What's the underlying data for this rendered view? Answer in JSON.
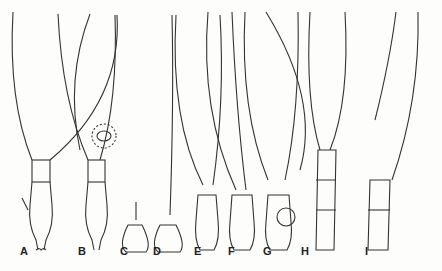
{
  "figure": {
    "labels": [
      {
        "id": "A",
        "text": "A",
        "x": 20,
        "y": 255
      },
      {
        "id": "B",
        "text": "B",
        "x": 78,
        "y": 255
      },
      {
        "id": "C",
        "text": "C",
        "x": 120,
        "y": 255
      },
      {
        "id": "D",
        "text": "D",
        "x": 153,
        "y": 255
      },
      {
        "id": "E",
        "text": "E",
        "x": 194,
        "y": 255
      },
      {
        "id": "F",
        "text": "F",
        "x": 228,
        "y": 255
      },
      {
        "id": "G",
        "text": "G",
        "x": 263,
        "y": 255
      },
      {
        "id": "H",
        "text": "H",
        "x": 301,
        "y": 255
      },
      {
        "id": "I",
        "text": "I",
        "x": 365,
        "y": 255
      }
    ],
    "colors": {
      "ink": "#333333",
      "paper": "#fdfdfb"
    }
  }
}
